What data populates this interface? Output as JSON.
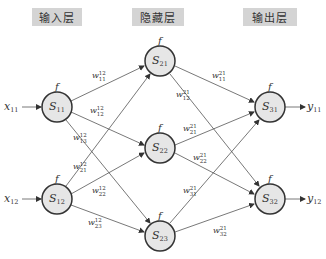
{
  "layers": [
    {
      "id": "input",
      "label": "输入层"
    },
    {
      "id": "hidden",
      "label": "隐藏层"
    },
    {
      "id": "output",
      "label": "输出层"
    }
  ],
  "activation_label": "f",
  "inputs": [
    {
      "var": "x",
      "sub": "11"
    },
    {
      "var": "x",
      "sub": "12"
    }
  ],
  "outputs": [
    {
      "var": "y",
      "sub": "11"
    },
    {
      "var": "y",
      "sub": "12"
    }
  ],
  "nodes": {
    "input": [
      {
        "name": "S",
        "sub": "11"
      },
      {
        "name": "S",
        "sub": "12"
      }
    ],
    "hidden": [
      {
        "name": "S",
        "sub": "21"
      },
      {
        "name": "S",
        "sub": "22"
      },
      {
        "name": "S",
        "sub": "23"
      }
    ],
    "output": [
      {
        "name": "S",
        "sub": "31"
      },
      {
        "name": "S",
        "sub": "32"
      }
    ]
  },
  "weights_input_hidden": [
    {
      "from": "S11",
      "to": "S21",
      "w": "w",
      "sup": "12",
      "sub": "11"
    },
    {
      "from": "S11",
      "to": "S22",
      "w": "w",
      "sup": "12",
      "sub": "12"
    },
    {
      "from": "S11",
      "to": "S23",
      "w": "w",
      "sup": "12",
      "sub": "13"
    },
    {
      "from": "S12",
      "to": "S21",
      "w": "w",
      "sup": "12",
      "sub": "21"
    },
    {
      "from": "S12",
      "to": "S22",
      "w": "w",
      "sup": "12",
      "sub": "22"
    },
    {
      "from": "S12",
      "to": "S23",
      "w": "w",
      "sup": "12",
      "sub": "23"
    }
  ],
  "weights_hidden_output": [
    {
      "from": "S21",
      "to": "S31",
      "w": "w",
      "sup": "21",
      "sub": "11"
    },
    {
      "from": "S21",
      "to": "S32",
      "w": "w",
      "sup": "21",
      "sub": "12"
    },
    {
      "from": "S22",
      "to": "S31",
      "w": "w",
      "sup": "21",
      "sub": "21"
    },
    {
      "from": "S22",
      "to": "S32",
      "w": "w",
      "sup": "21",
      "sub": "22"
    },
    {
      "from": "S23",
      "to": "S31",
      "w": "w",
      "sup": "21",
      "sub": "31"
    },
    {
      "from": "S23",
      "to": "S32",
      "w": "w",
      "sup": "21",
      "sub": "32"
    }
  ]
}
